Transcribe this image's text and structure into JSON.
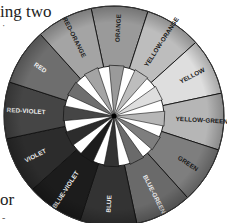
{
  "text_fragments": {
    "top": "ing two",
    "top_mark": "·",
    "bottom": "or",
    "bottom_mark": "-"
  },
  "color_wheel": {
    "center": [
      114,
      116
    ],
    "outer_radius": 110,
    "inner_radius": 50,
    "start_angle_deg": -87,
    "segments": [
      {
        "label": "ORANGE",
        "fill": "#9a9a9a",
        "text": "#1a1a1a"
      },
      {
        "label": "YELLOW-ORANGE",
        "fill": "#bdbdbd",
        "text": "#1a1a1a"
      },
      {
        "label": "YELLOW",
        "fill": "#dedede",
        "text": "#1a1a1a"
      },
      {
        "label": "YELLOW-GREEN",
        "fill": "#b6b6b6",
        "text": "#1a1a1a"
      },
      {
        "label": "GREEN",
        "fill": "#7e7e7e",
        "text": "#1a1a1a"
      },
      {
        "label": "BLUE-GREEN",
        "fill": "#6a6a6a",
        "text": "#eeeeee"
      },
      {
        "label": "BLUE",
        "fill": "#333333",
        "text": "#eeeeee"
      },
      {
        "label": "BLUE-VIOLET",
        "fill": "#1c1c1c",
        "text": "#eeeeee"
      },
      {
        "label": "VIOLET",
        "fill": "#2c2c2c",
        "text": "#eeeeee"
      },
      {
        "label": "RED-VIOLET",
        "fill": "#454545",
        "text": "#eeeeee"
      },
      {
        "label": "RED",
        "fill": "#6e6e6e",
        "text": "#eeeeee"
      },
      {
        "label": "RED-ORANGE",
        "fill": "#a4a4a4",
        "text": "#1a1a1a"
      }
    ]
  }
}
